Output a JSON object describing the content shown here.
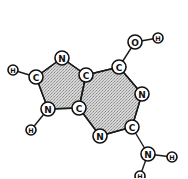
{
  "diagram": {
    "colors": {
      "stroke": "#111111",
      "fill": "#ffffff",
      "stipple": "#9a9a9a"
    },
    "atoms": [
      {
        "id": "h8",
        "label": "H",
        "x": 13,
        "y": 70,
        "r": 5
      },
      {
        "id": "c8",
        "label": "C",
        "x": 36,
        "y": 77,
        "r": 7
      },
      {
        "id": "n7",
        "label": "N",
        "x": 62,
        "y": 58,
        "r": 7
      },
      {
        "id": "c5",
        "label": "C",
        "x": 86,
        "y": 75,
        "r": 7
      },
      {
        "id": "c4",
        "label": "C",
        "x": 79,
        "y": 108,
        "r": 7
      },
      {
        "id": "n9",
        "label": "N",
        "x": 48,
        "y": 109,
        "r": 7
      },
      {
        "id": "h9",
        "label": "H",
        "x": 31,
        "y": 130,
        "r": 5
      },
      {
        "id": "c6",
        "label": "C",
        "x": 119,
        "y": 67,
        "r": 7
      },
      {
        "id": "o6",
        "label": "O",
        "x": 135,
        "y": 42,
        "r": 7
      },
      {
        "id": "h6",
        "label": "H",
        "x": 158,
        "y": 38,
        "r": 5
      },
      {
        "id": "n1",
        "label": "N",
        "x": 142,
        "y": 94,
        "r": 7
      },
      {
        "id": "c2",
        "label": "C",
        "x": 132,
        "y": 127,
        "r": 7
      },
      {
        "id": "n3",
        "label": "N",
        "x": 100,
        "y": 136,
        "r": 7
      },
      {
        "id": "n2",
        "label": "N",
        "x": 148,
        "y": 154,
        "r": 7
      },
      {
        "id": "h2a",
        "label": "H",
        "x": 172,
        "y": 157,
        "r": 5
      },
      {
        "id": "h2b",
        "label": "H",
        "x": 140,
        "y": 176,
        "r": 5
      }
    ],
    "bonds": [
      [
        "h8",
        "c8"
      ],
      [
        "c8",
        "n7"
      ],
      [
        "n7",
        "c5"
      ],
      [
        "c5",
        "c4"
      ],
      [
        "c4",
        "n9"
      ],
      [
        "n9",
        "c8"
      ],
      [
        "n9",
        "h9"
      ],
      [
        "c5",
        "c6"
      ],
      [
        "c6",
        "o6"
      ],
      [
        "o6",
        "h6"
      ],
      [
        "c6",
        "n1"
      ],
      [
        "n1",
        "c2"
      ],
      [
        "c2",
        "n3"
      ],
      [
        "n3",
        "c4"
      ],
      [
        "c2",
        "n2"
      ],
      [
        "n2",
        "h2a"
      ],
      [
        "n2",
        "h2b"
      ]
    ],
    "rings": [
      {
        "name": "imidazole-ring",
        "atoms": [
          "c8",
          "n7",
          "c5",
          "c4",
          "n9"
        ]
      },
      {
        "name": "pyrimidine-ring",
        "atoms": [
          "c5",
          "c6",
          "n1",
          "c2",
          "n3",
          "c4"
        ]
      }
    ]
  }
}
